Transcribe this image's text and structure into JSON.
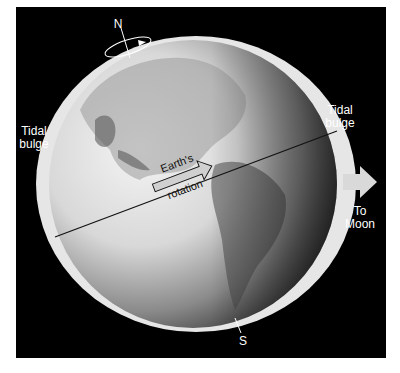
{
  "figure": {
    "background_color": "#000000",
    "frame_color": "#ffffff"
  },
  "labels": {
    "north": "N",
    "south": "S",
    "tidal_bulge_left": {
      "line1": "Tidal",
      "line2": "bulge"
    },
    "tidal_bulge_right": {
      "line1": "Tidal",
      "line2": "bulge"
    },
    "rotation": {
      "line1": "Earth's",
      "line2": "rotation"
    },
    "moon": {
      "line1": "To",
      "line2": "Moon"
    }
  },
  "icons": {
    "rotation_axis_ellipse": "rotation-ellipse-arrow",
    "moon_direction": "right-arrow"
  },
  "colors": {
    "bulge": "#e8e8e8",
    "globe_light": "#f2f2f2",
    "globe_dark": "#3a3a3a",
    "arrow": "#d9d9d9",
    "text": "#ffffff"
  }
}
